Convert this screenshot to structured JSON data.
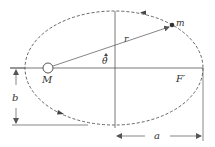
{
  "diagram": {
    "type": "orbital-ellipse",
    "labels": {
      "central_mass": "M",
      "orbiting_mass": "m",
      "radius": "r",
      "angle": "θ",
      "empty_focus": "F′",
      "semi_major_axis": "a",
      "semi_minor_axis": "b"
    },
    "colors": {
      "line": "#555555",
      "text": "#333333",
      "background": "#ffffff"
    }
  }
}
